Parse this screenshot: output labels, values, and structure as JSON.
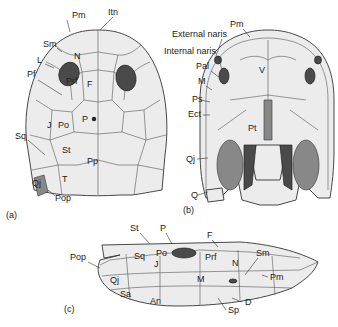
{
  "figure": {
    "panels": [
      {
        "id": "a",
        "caption": "(a)",
        "view": "dorsal",
        "labels": [
          "Pm",
          "Itn",
          "Sm",
          "N",
          "L",
          "Pf",
          "Prf",
          "F",
          "J",
          "Po",
          "P",
          "Sq",
          "St",
          "Pp",
          "Qj",
          "T",
          "Pop"
        ]
      },
      {
        "id": "b",
        "caption": "(b)",
        "view": "palatal",
        "labels": [
          "Pm",
          "External naris",
          "Internal naris",
          "Pal",
          "V",
          "M",
          "Ps",
          "Ect",
          "Pt",
          "Qj",
          "Q"
        ]
      },
      {
        "id": "c",
        "caption": "(c)",
        "view": "lateral",
        "labels": [
          "St",
          "P",
          "Po",
          "F",
          "Pop",
          "Sq",
          "J",
          "Prf",
          "N",
          "Sm",
          "Pm",
          "Qj",
          "M",
          "Sa",
          "An",
          "D",
          "Sp"
        ]
      }
    ]
  },
  "a": {
    "caption": "(a)",
    "Pm": "Pm",
    "Itn": "Itn",
    "Sm": "Sm",
    "N": "N",
    "L": "L",
    "Pf": "Pf",
    "Prf": "Prf",
    "F": "F",
    "J": "J",
    "Po": "Po",
    "P": "P",
    "Sq": "Sq",
    "St": "St",
    "Pp": "Pp",
    "Qj": "Qj",
    "T": "T",
    "Pop": "Pop"
  },
  "b": {
    "caption": "(b)",
    "Pm": "Pm",
    "ext_naris": "External naris",
    "int_naris": "Internal naris",
    "Pal": "Pal",
    "V": "V",
    "M": "M",
    "Ps": "Ps",
    "Ect": "Ect",
    "Pt": "Pt",
    "Qj": "Qj",
    "Q": "Q"
  },
  "c": {
    "caption": "(c)",
    "St": "St",
    "P": "P",
    "Po": "Po",
    "F": "F",
    "Pop": "Pop",
    "Sq": "Sq",
    "J": "J",
    "Prf": "Prf",
    "N": "N",
    "Sm": "Sm",
    "Pm": "Pm",
    "Qj": "Qj",
    "M": "M",
    "Sa": "Sa",
    "An": "An",
    "D": "D",
    "Sp": "Sp"
  }
}
